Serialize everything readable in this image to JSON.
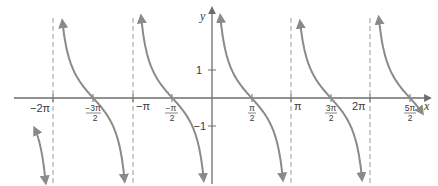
{
  "chart_data": {
    "type": "line",
    "function": "y = cot x",
    "title": "",
    "xlabel": "x",
    "ylabel": "y",
    "xlim": [
      -7.0,
      8.3
    ],
    "ylim": [
      -3.1,
      3.5
    ],
    "grid": false,
    "legend": null,
    "colors": {
      "curve": "#8a8a8a",
      "axis": "#6e6e6e",
      "asymptote": "#9a9a9a",
      "text": "#3a3a3a"
    },
    "asymptotes": [
      "-2π",
      "-π",
      "0",
      "π",
      "2π"
    ],
    "zeros": [
      "-3π/2",
      "-π/2",
      "π/2",
      "3π/2",
      "5π/2"
    ],
    "x_ticks": [
      {
        "value": -6.2832,
        "label": "−2π",
        "type": "plain"
      },
      {
        "value": -4.7124,
        "label_num": "−3π",
        "label_den": "2",
        "type": "fraction"
      },
      {
        "value": -3.1416,
        "label": "−π",
        "type": "plain"
      },
      {
        "value": -1.5708,
        "label_num": "−π",
        "label_den": "2",
        "type": "fraction"
      },
      {
        "value": 1.5708,
        "label_num": "π",
        "label_den": "2",
        "type": "fraction"
      },
      {
        "value": 3.1416,
        "label": "π",
        "type": "plain"
      },
      {
        "value": 4.7124,
        "label_num": "3π",
        "label_den": "2",
        "type": "fraction"
      },
      {
        "value": 6.2832,
        "label": "2π",
        "type": "plain"
      },
      {
        "value": 7.854,
        "label_num": "5π",
        "label_den": "2",
        "type": "fraction"
      }
    ],
    "y_ticks": [
      {
        "value": 1,
        "label": "1"
      },
      {
        "value": -1,
        "label": "−1"
      }
    ],
    "branches": [
      {
        "x_from": -7.0,
        "x_to": -6.35,
        "note": "partial branch left of −2π, descending to −∞"
      },
      {
        "x_from": -6.2,
        "x_to": -3.2,
        "note": "full branch between −2π and −π"
      },
      {
        "x_from": -3.08,
        "x_to": -0.06,
        "note": "full branch between −π and 0"
      },
      {
        "x_from": 0.06,
        "x_to": 3.08,
        "note": "full branch between 0 and π"
      },
      {
        "x_from": 3.2,
        "x_to": 6.22,
        "note": "full branch between π and 2π"
      },
      {
        "x_from": 6.35,
        "x_to": 8.3,
        "note": "partial branch right of 2π, crossing zero at 5π/2"
      }
    ]
  },
  "labels": {
    "x_axis": "x",
    "y_axis": "y",
    "tick_neg_2pi": "−2π",
    "tick_neg_3pi_2_num": "−3π",
    "tick_neg_3pi_2_den": "2",
    "tick_neg_pi": "−π",
    "tick_neg_pi_2_num": "−π",
    "tick_neg_pi_2_den": "2",
    "tick_pi_2_num": "π",
    "tick_pi_2_den": "2",
    "tick_pi": "π",
    "tick_3pi_2_num": "3π",
    "tick_3pi_2_den": "2",
    "tick_2pi": "2π",
    "tick_5pi_2_num": "5π",
    "tick_5pi_2_den": "2",
    "y_tick_1": "1",
    "y_tick_neg1": "−1"
  }
}
